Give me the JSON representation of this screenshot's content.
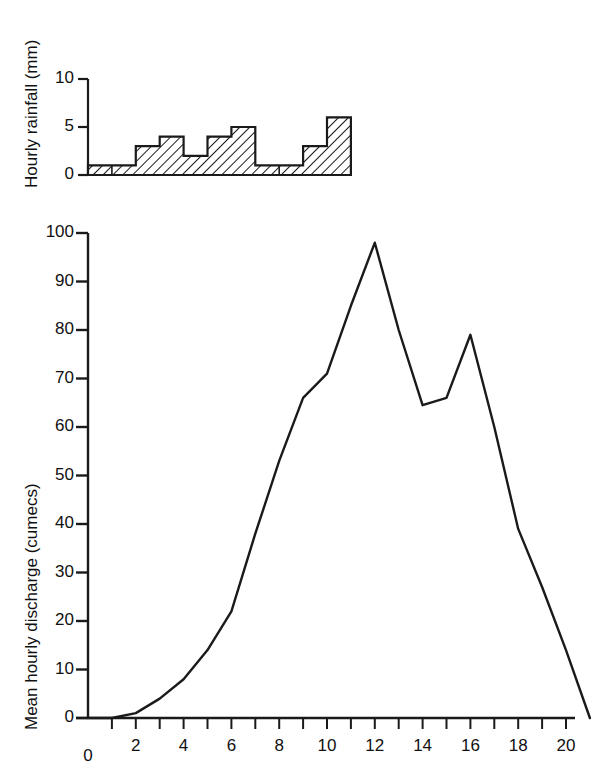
{
  "figure": {
    "kind": "hydrograph",
    "background_color": "#ffffff",
    "line_color": "#1a1a1a"
  },
  "rainfall_panel": {
    "ylabel": "Hourly rainfall (mm)",
    "ytick_labels": [
      "0",
      "5",
      "10"
    ],
    "ytick_values": [
      0,
      5,
      10
    ]
  },
  "discharge_panel": {
    "ylabel": "Mean hourly discharge (cumecs)",
    "ytick_labels": [
      "0",
      "10",
      "20",
      "30",
      "40",
      "50",
      "60",
      "70",
      "80",
      "90",
      "100"
    ],
    "ytick_values": [
      0,
      10,
      20,
      30,
      40,
      50,
      60,
      70,
      80,
      90,
      100
    ],
    "xtick_labels": [
      "0",
      "2",
      "4",
      "6",
      "8",
      "10",
      "12",
      "14",
      "16",
      "18",
      "20"
    ],
    "xtick_values": [
      0,
      2,
      4,
      6,
      8,
      10,
      12,
      14,
      16,
      18,
      20
    ]
  },
  "chart_data": [
    {
      "type": "bar",
      "title": "",
      "xlabel": "",
      "ylabel": "Hourly rainfall (mm)",
      "ylim": [
        0,
        10
      ],
      "xlim": [
        0,
        21
      ],
      "grid": false,
      "legend": null,
      "bar_style": "hatched-diagonal",
      "bar_width_hours": 1,
      "categories": [
        "0-1",
        "1-2",
        "2-3",
        "3-4",
        "4-5",
        "5-6",
        "6-7",
        "7-8",
        "8-9",
        "9-10"
      ],
      "x": [
        0,
        1,
        2,
        3,
        4,
        5,
        6,
        7,
        8,
        9
      ],
      "values": [
        1,
        1,
        3,
        4,
        2,
        4,
        5,
        1,
        1,
        3
      ],
      "tail_values": [
        6
      ],
      "tail_x": [
        10
      ],
      "all_x": [
        0,
        1,
        2,
        3,
        4,
        5,
        6,
        7,
        8,
        9,
        10
      ],
      "all_values": [
        1,
        1,
        3,
        4,
        2,
        4,
        5,
        1,
        1,
        3,
        6
      ],
      "ytick_labels": [
        "0",
        "5",
        "10"
      ],
      "ytick_values": [
        0,
        5,
        10
      ]
    },
    {
      "type": "line",
      "title": "",
      "xlabel": "",
      "ylabel": "Mean hourly discharge (cumecs)",
      "ylim": [
        0,
        100
      ],
      "xlim": [
        0,
        21
      ],
      "grid": false,
      "legend": null,
      "series": [
        {
          "name": "Mean hourly discharge",
          "x": [
            0,
            1,
            2,
            3,
            4,
            5,
            6,
            7,
            8,
            9,
            10,
            11,
            12,
            13,
            14,
            15,
            16,
            17,
            18,
            19,
            20,
            21
          ],
          "values": [
            0,
            0,
            1,
            4,
            8,
            14,
            22,
            38,
            53,
            66,
            71,
            85,
            98,
            80,
            64.5,
            66,
            79,
            60,
            39,
            27,
            14,
            0
          ]
        }
      ],
      "xtick_labels": [
        "0",
        "2",
        "4",
        "6",
        "8",
        "10",
        "12",
        "14",
        "16",
        "18",
        "20"
      ],
      "xtick_values": [
        0,
        2,
        4,
        6,
        8,
        10,
        12,
        14,
        16,
        18,
        20
      ],
      "ytick_labels": [
        "0",
        "10",
        "20",
        "30",
        "40",
        "50",
        "60",
        "70",
        "80",
        "90",
        "100"
      ],
      "ytick_values": [
        0,
        10,
        20,
        30,
        40,
        50,
        60,
        70,
        80,
        90,
        100
      ]
    }
  ]
}
